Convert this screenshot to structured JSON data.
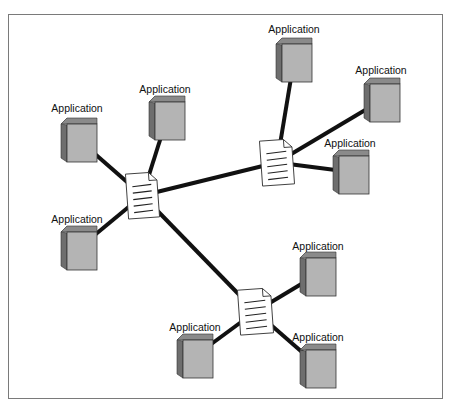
{
  "diagram": {
    "colors": {
      "frame": "#7a7a7a",
      "connector": "#111111",
      "box_front": "#b4b4b4",
      "box_side": "#6e6e6e",
      "box_top": "#8a8a8a",
      "doc_fill": "#ffffff",
      "doc_stroke": "#333333"
    },
    "hubs": [
      {
        "id": "hub-1",
        "icon": "document-icon",
        "x": 127,
        "y": 173,
        "w": 31,
        "h": 45,
        "rot": -4
      },
      {
        "id": "hub-2",
        "icon": "document-icon",
        "x": 261,
        "y": 140,
        "w": 32,
        "h": 45,
        "rot": -4
      },
      {
        "id": "hub-3",
        "icon": "document-icon",
        "x": 239,
        "y": 289,
        "w": 33,
        "h": 45,
        "rot": -4
      }
    ],
    "applications": [
      {
        "id": "app-1",
        "label": "Application",
        "label_x": 77,
        "label_y": 102,
        "x": 61,
        "y": 118,
        "hub": 0
      },
      {
        "id": "app-2",
        "label": "Application",
        "label_x": 165,
        "label_y": 83,
        "x": 149,
        "y": 96,
        "hub": 0
      },
      {
        "id": "app-3",
        "label": "Application",
        "label_x": 77,
        "label_y": 213,
        "x": 61,
        "y": 226,
        "hub": 0
      },
      {
        "id": "app-4",
        "label": "Application",
        "label_x": 294,
        "label_y": 23,
        "x": 276,
        "y": 38,
        "hub": 1
      },
      {
        "id": "app-5",
        "label": "Application",
        "label_x": 381,
        "label_y": 64,
        "x": 364,
        "y": 78,
        "hub": 1
      },
      {
        "id": "app-6",
        "label": "Application",
        "label_x": 350,
        "label_y": 137,
        "x": 333,
        "y": 150,
        "hub": 1
      },
      {
        "id": "app-7",
        "label": "Application",
        "label_x": 318,
        "label_y": 240,
        "x": 300,
        "y": 252,
        "hub": 2
      },
      {
        "id": "app-8",
        "label": "Application",
        "label_x": 195,
        "label_y": 321,
        "x": 177,
        "y": 334,
        "hub": 2
      },
      {
        "id": "app-9",
        "label": "Application",
        "label_x": 318,
        "label_y": 331,
        "x": 300,
        "y": 344,
        "hub": 2
      }
    ],
    "links": [
      {
        "from": "hub-1",
        "to": "hub-2"
      },
      {
        "from": "hub-1",
        "to": "hub-3"
      }
    ],
    "box_size": {
      "w": 36,
      "h": 44,
      "depth": 6
    }
  }
}
